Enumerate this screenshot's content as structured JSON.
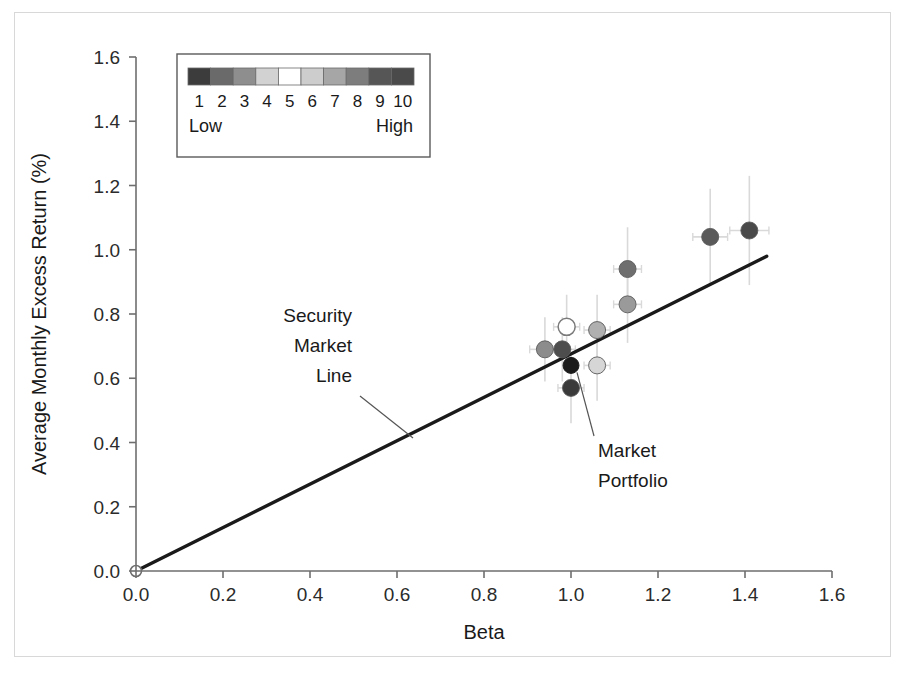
{
  "chart_data": {
    "type": "scatter",
    "title": "",
    "xlabel": "Beta",
    "ylabel": "Average Monthly Excess Return (%)",
    "xlim": [
      0.0,
      1.6
    ],
    "ylim": [
      0.0,
      1.6
    ],
    "xticks": [
      "0.0",
      "0.2",
      "0.4",
      "0.6",
      "0.8",
      "1.0",
      "1.2",
      "1.4",
      "1.6"
    ],
    "yticks": [
      "0.0",
      "0.2",
      "0.4",
      "0.6",
      "0.8",
      "1.0",
      "1.2",
      "1.4",
      "1.6"
    ],
    "grid": false,
    "legend_position": "top-left-inset",
    "series": [
      {
        "name": "Beta-sorted decile portfolios",
        "points": [
          {
            "label": "1",
            "x": 0.94,
            "y": 0.69,
            "color": "#8c8c8c",
            "yerr": 0.1,
            "xerr": 0.035,
            "filled": true
          },
          {
            "label": "2",
            "x": 0.98,
            "y": 0.69,
            "color": "#4d4d4d",
            "yerr": 0.1,
            "xerr": 0.03,
            "filled": true
          },
          {
            "label": "3",
            "x": 1.0,
            "y": 0.57,
            "color": "#3a3a3a",
            "yerr": 0.11,
            "xerr": 0.03,
            "filled": true
          },
          {
            "label": "4",
            "x": 0.99,
            "y": 0.76,
            "color": "#ffffff",
            "yerr": 0.1,
            "xerr": 0.03,
            "filled": false
          },
          {
            "label": "5",
            "x": 1.06,
            "y": 0.64,
            "color": "#d6d6d6",
            "yerr": 0.11,
            "xerr": 0.03,
            "filled": true
          },
          {
            "label": "6",
            "x": 1.06,
            "y": 0.75,
            "color": "#b0b0b0",
            "yerr": 0.11,
            "xerr": 0.03,
            "filled": true
          },
          {
            "label": "7",
            "x": 1.13,
            "y": 0.83,
            "color": "#9a9a9a",
            "yerr": 0.12,
            "xerr": 0.032,
            "filled": true
          },
          {
            "label": "8",
            "x": 1.13,
            "y": 0.94,
            "color": "#6e6e6e",
            "yerr": 0.13,
            "xerr": 0.032,
            "filled": true
          },
          {
            "label": "9",
            "x": 1.32,
            "y": 1.04,
            "color": "#5a5a5a",
            "yerr": 0.15,
            "xerr": 0.04,
            "filled": true
          },
          {
            "label": "10",
            "x": 1.41,
            "y": 1.06,
            "color": "#4a4a4a",
            "yerr": 0.17,
            "xerr": 0.045,
            "filled": true
          }
        ]
      },
      {
        "name": "Market Portfolio",
        "points": [
          {
            "label": "Market",
            "x": 1.0,
            "y": 0.64,
            "color": "#1a1a1a",
            "yerr": 0,
            "xerr": 0,
            "filled": true
          }
        ]
      }
    ],
    "line": {
      "name": "Security Market Line",
      "x0": 0.0,
      "y0": 0.0,
      "x1": 1.45,
      "y1": 0.98,
      "origin_marker": "open-circle"
    },
    "annotations": [
      {
        "name": "security-market-line",
        "lines": [
          "Security",
          "Market",
          "Line"
        ]
      },
      {
        "name": "market-portfolio",
        "lines": [
          "Market",
          "Portfolio"
        ]
      }
    ]
  },
  "legend": {
    "name": "beta-decile-legend",
    "numbers": [
      "1",
      "2",
      "3",
      "4",
      "5",
      "6",
      "7",
      "8",
      "9",
      "10"
    ],
    "low_label": "Low",
    "high_label": "High",
    "swatches": [
      "#3c3c3c",
      "#6a6a6a",
      "#8e8e8e",
      "#d2d2d2",
      "#ffffff",
      "#cdcdcd",
      "#a6a6a6",
      "#7d7d7d",
      "#565656",
      "#4a4a4a"
    ]
  },
  "axes": {
    "x_title": "Beta",
    "y_title": "Average Monthly Excess Return (%)"
  },
  "colors": {
    "axis": "#6e6e6e",
    "text": "#1a1a1a",
    "sml": "#1a1a1a",
    "errorbar": "#d9d9d9",
    "frame": "#d8d8d8"
  }
}
